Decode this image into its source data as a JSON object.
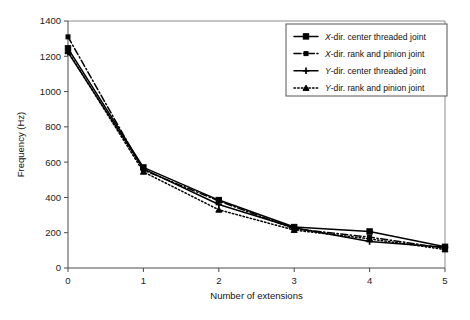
{
  "chart_data": {
    "type": "line",
    "title": "",
    "subtitle": "",
    "xlabel": "Number of extensions",
    "ylabel": "Frequency (Hz)",
    "x": [
      0,
      1,
      2,
      3,
      4,
      5
    ],
    "xlim": [
      0,
      5
    ],
    "ylim": [
      0,
      1400
    ],
    "xticks": [
      "0",
      "1",
      "2",
      "3",
      "4",
      "5"
    ],
    "yticks": [
      "0",
      "200",
      "400",
      "600",
      "800",
      "1000",
      "1200",
      "1400"
    ],
    "grid": false,
    "legend_position": "top-right",
    "series": [
      {
        "name": "X-dir. center threaded joint",
        "name_italic_prefix": "X",
        "name_rest": "-dir. center threaded joint",
        "values": [
          1245,
          570,
          385,
          232,
          207,
          120
        ],
        "line_style": "solid",
        "marker": "square",
        "color": "#000000"
      },
      {
        "name": "X-dir. rank and pinion joint",
        "name_italic_prefix": "X",
        "name_rest": "-dir. rank and pinion joint",
        "values": [
          1310,
          555,
          380,
          222,
          175,
          112
        ],
        "line_style": "dash-dot",
        "marker": "small-square",
        "color": "#000000"
      },
      {
        "name": "Y-dir. center threaded joint",
        "name_italic_prefix": "Y",
        "name_rest": "-dir. center threaded joint",
        "values": [
          1222,
          562,
          360,
          228,
          150,
          118
        ],
        "line_style": "solid",
        "marker": "plus",
        "color": "#000000"
      },
      {
        "name": "Y-dir. rank and pinion joint",
        "name_italic_prefix": "Y",
        "name_rest": "-dir. rank and pinion joint",
        "values": [
          1228,
          545,
          330,
          215,
          165,
          105
        ],
        "line_style": "dotted",
        "marker": "triangle",
        "color": "#000000"
      }
    ]
  }
}
